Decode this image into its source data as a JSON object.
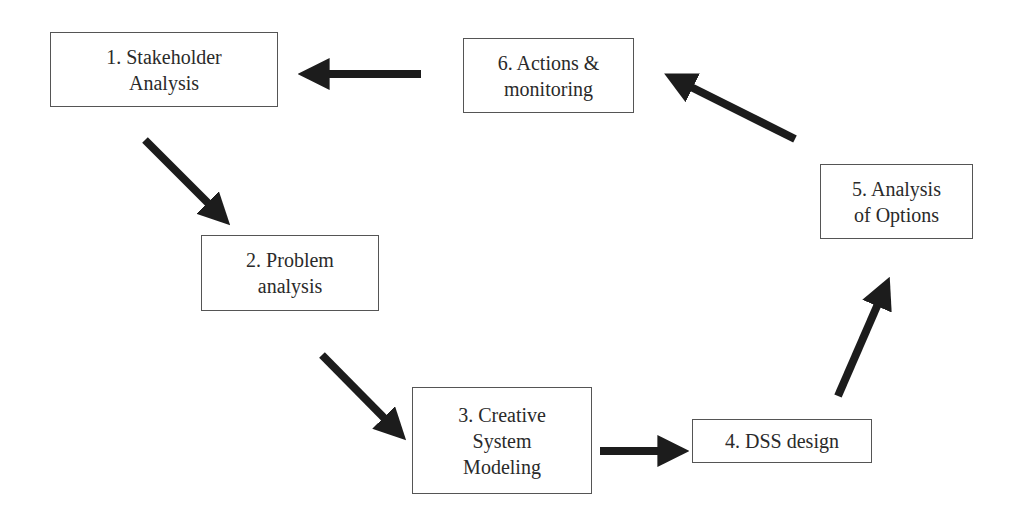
{
  "diagram": {
    "type": "cycle-flow",
    "colors": {
      "box_border": "#555555",
      "text": "#2a2a2a",
      "arrow": "#1c1c1c",
      "background": "#ffffff"
    },
    "nodes": [
      {
        "id": 1,
        "lines": [
          "1. Stakeholder",
          "Analysis"
        ]
      },
      {
        "id": 2,
        "lines": [
          "2. Problem",
          "analysis"
        ]
      },
      {
        "id": 3,
        "lines": [
          "3. Creative",
          "System",
          "Modeling"
        ]
      },
      {
        "id": 4,
        "lines": [
          "4. DSS design"
        ]
      },
      {
        "id": 5,
        "lines": [
          "5. Analysis",
          "of Options"
        ]
      },
      {
        "id": 6,
        "lines": [
          "6. Actions &",
          "monitoring"
        ]
      }
    ],
    "edges": [
      {
        "from": 1,
        "to": 2
      },
      {
        "from": 2,
        "to": 3
      },
      {
        "from": 3,
        "to": 4
      },
      {
        "from": 4,
        "to": 5
      },
      {
        "from": 5,
        "to": 6
      },
      {
        "from": 6,
        "to": 1
      }
    ]
  }
}
